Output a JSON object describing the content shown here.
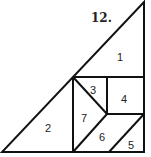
{
  "figure": {
    "number_label": "12.",
    "pieces": [
      {
        "id": "1",
        "label": "1"
      },
      {
        "id": "2",
        "label": "2"
      },
      {
        "id": "3",
        "label": "3"
      },
      {
        "id": "4",
        "label": "4"
      },
      {
        "id": "5",
        "label": "5"
      },
      {
        "id": "6",
        "label": "6"
      },
      {
        "id": "7",
        "label": "7"
      }
    ]
  }
}
